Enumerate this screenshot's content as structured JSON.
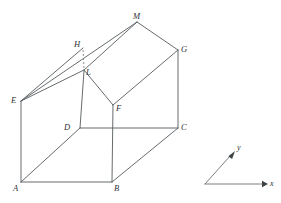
{
  "figure": {
    "kind": "3d-line-diagram",
    "stroke_color": "#555a5e",
    "dashed_color": "#7c8186",
    "background_color": "#ffffff",
    "vertices": [
      {
        "id": "A",
        "label": "A",
        "x": 21,
        "y": 182,
        "label_x": 13,
        "label_y": 184
      },
      {
        "id": "B",
        "label": "B",
        "x": 112,
        "y": 182,
        "label_x": 114,
        "label_y": 184
      },
      {
        "id": "C",
        "label": "C",
        "x": 178,
        "y": 128,
        "label_x": 181,
        "label_y": 123
      },
      {
        "id": "D",
        "label": "D",
        "x": 80,
        "y": 128,
        "label_x": 64,
        "label_y": 123
      },
      {
        "id": "E",
        "label": "E",
        "x": 21,
        "y": 101,
        "label_x": 11,
        "label_y": 96
      },
      {
        "id": "F",
        "label": "F",
        "x": 113,
        "y": 105,
        "label_x": 116,
        "label_y": 104
      },
      {
        "id": "G",
        "label": "G",
        "x": 178,
        "y": 50,
        "label_x": 181,
        "label_y": 45
      },
      {
        "id": "H",
        "label": "H",
        "x": 83,
        "y": 48,
        "label_x": 74,
        "label_y": 40
      },
      {
        "id": "L",
        "label": "L",
        "x": 84,
        "y": 70,
        "label_x": 86,
        "label_y": 68
      },
      {
        "id": "M",
        "label": "M",
        "x": 137,
        "y": 22,
        "label_x": 133,
        "label_y": 12
      }
    ],
    "solid_edges": [
      [
        "A",
        "B"
      ],
      [
        "A",
        "E"
      ],
      [
        "A",
        "D"
      ],
      [
        "B",
        "C"
      ],
      [
        "B",
        "F"
      ],
      [
        "C",
        "D"
      ],
      [
        "C",
        "G"
      ],
      [
        "D",
        "L"
      ],
      [
        "E",
        "H"
      ],
      [
        "E",
        "M"
      ],
      [
        "E",
        "L"
      ],
      [
        "F",
        "G"
      ],
      [
        "F",
        "L"
      ],
      [
        "G",
        "M"
      ],
      [
        "L",
        "M"
      ]
    ],
    "dashed_edges": [
      [
        "H",
        "L"
      ]
    ]
  },
  "axes": {
    "origin": {
      "x": 205,
      "y": 184
    },
    "x_axis": {
      "label": "x",
      "tip_x": 266,
      "tip_y": 184,
      "label_x": 270,
      "label_y": 180
    },
    "y_axis": {
      "label": "y",
      "tip_x": 234,
      "tip_y": 152,
      "label_x": 237,
      "label_y": 144
    }
  }
}
